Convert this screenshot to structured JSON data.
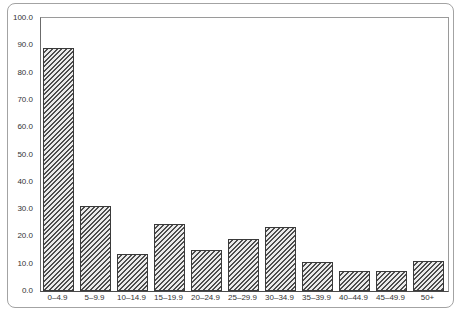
{
  "chart_data": {
    "type": "bar",
    "title": "",
    "xlabel": "",
    "ylabel": "",
    "categories": [
      "0–4.9",
      "5–9.9",
      "10–14.9",
      "15–19.9",
      "20–24.9",
      "25–29.9",
      "30–34.9",
      "35–39.9",
      "40–44.9",
      "45–49.9",
      "50+"
    ],
    "values": [
      89,
      31,
      13.5,
      24.5,
      15,
      19,
      23.5,
      10.5,
      7.5,
      7.5,
      11
    ],
    "ylim": [
      0,
      100
    ],
    "ytick_labels": [
      "0.0",
      "10.0",
      "20.0",
      "30.0",
      "40.0",
      "50.0",
      "60.0",
      "70.0",
      "80.0",
      "90.0",
      "100.0"
    ],
    "grid": false,
    "legend": null,
    "style": {
      "bar_fill": "diagonal-hatch",
      "hatch_light": "#ebebeb",
      "hatch_dark": "#4d4d4d",
      "bar_border": "#3a3a3a",
      "frame_border": "#a3a3a3",
      "axis_color": "#4a4a4a",
      "text_color": "#333333",
      "background": "#ffffff"
    }
  }
}
